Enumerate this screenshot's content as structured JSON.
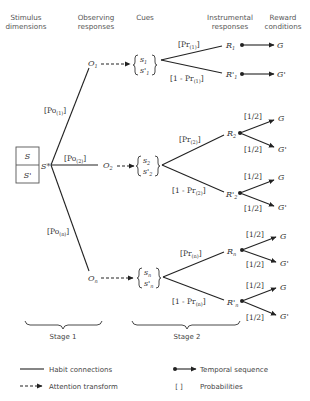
{
  "headers": {
    "stimulus": [
      "Stimulus",
      "dimensions"
    ],
    "observing": [
      "Observing",
      "responses"
    ],
    "cues": "Cues",
    "instrumental": [
      "Instrumental",
      "responses"
    ],
    "reward": [
      "Reward",
      "conditions"
    ]
  },
  "stimulus_box": {
    "top": "S",
    "bottom": "S'",
    "compound": "S*"
  },
  "observing_branches": [
    {
      "label": "[Po(1)]",
      "main": "[Po",
      "sub": "(1)",
      "close": "]",
      "node": "O",
      "node_sub": "1",
      "cue_top": "s",
      "cue_top_sub": "1",
      "cue_bot": "s'",
      "cue_bot_sub": "1"
    },
    {
      "label": "[Po(2)]",
      "main": "[Po",
      "sub": "(2)",
      "close": "]",
      "node": "O",
      "node_sub": "2",
      "cue_top": "s",
      "cue_top_sub": "2",
      "cue_bot": "s'",
      "cue_bot_sub": "2"
    },
    {
      "label": "[Po(n)]",
      "main": "[Po",
      "sub": "(n)",
      "close": "]",
      "node": "O",
      "node_sub": "n",
      "cue_top": "s",
      "cue_top_sub": "n",
      "cue_bot": "s'",
      "cue_bot_sub": "n"
    }
  ],
  "instrumental_branches": [
    {
      "upper_prob": "[Pr",
      "upper_sub": "(1)",
      "lower_prob": "[1 - Pr",
      "lower_sub": "(1)",
      "R": "R",
      "R_sub": "1",
      "Rp": "R'",
      "Rp_sub": "1",
      "rewards": {
        "R": [
          {
            "prob": "",
            "label": "G"
          }
        ],
        "Rp": [
          {
            "prob": "",
            "label": "G'"
          }
        ]
      }
    },
    {
      "upper_prob": "[Pr",
      "upper_sub": "(2)",
      "lower_prob": "[1 - Pr",
      "lower_sub": "(2)",
      "R": "R",
      "R_sub": "2",
      "Rp": "R'",
      "Rp_sub": "2",
      "rewards": {
        "R": [
          {
            "prob": "[1/2]",
            "label": "G"
          },
          {
            "prob": "[1/2]",
            "label": "G'"
          }
        ],
        "Rp": [
          {
            "prob": "[1/2]",
            "label": "G"
          },
          {
            "prob": "[1/2]",
            "label": "G'"
          }
        ]
      }
    },
    {
      "upper_prob": "[Pr",
      "upper_sub": "(n)",
      "lower_prob": "[1 - Pr",
      "lower_sub": "(n)",
      "R": "R",
      "R_sub": "n",
      "Rp": "R'",
      "Rp_sub": "n",
      "rewards": {
        "R": [
          {
            "prob": "[1/2]",
            "label": "G"
          },
          {
            "prob": "[1/2]",
            "label": "G'"
          }
        ],
        "Rp": [
          {
            "prob": "[1/2]",
            "label": "G"
          },
          {
            "prob": "[1/2]",
            "label": "G'"
          }
        ]
      }
    }
  ],
  "stages": {
    "stage1": "Stage 1",
    "stage2": "Stage 2"
  },
  "legend": {
    "habit": "Habit connections",
    "attention": "Attention transform",
    "temporal": "Temporal sequence",
    "prob_symbol": "[ ]",
    "probabilities": "Probabilities"
  }
}
